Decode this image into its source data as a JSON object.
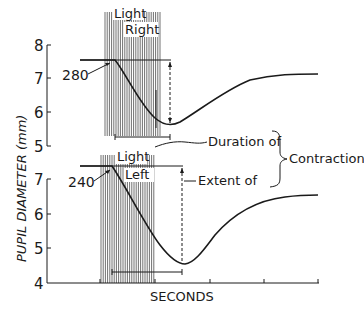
{
  "chart_data": {
    "type": "line",
    "ylabel": "PUPIL DIAMETER (mm)",
    "xlabel": "SECONDS",
    "grid": false,
    "panels": [
      {
        "name": "top",
        "stimulus_label": [
          "Light",
          "Right"
        ],
        "latency_label": "280",
        "yticks": [
          5,
          6,
          7,
          8
        ],
        "ylim": [
          5,
          8
        ],
        "series": [
          {
            "name": "pupil diameter (light right)",
            "x": [
              0,
              0.6,
              1.0,
              1.5,
              2.0,
              2.5,
              3.0,
              3.5,
              4.0
            ],
            "y": [
              7.5,
              7.5,
              6.8,
              6.0,
              5.6,
              6.0,
              6.6,
              6.95,
              7.1
            ]
          }
        ]
      },
      {
        "name": "bottom",
        "stimulus_label": [
          "Light",
          "Left"
        ],
        "latency_label": "240",
        "yticks": [
          4,
          5,
          6,
          7
        ],
        "ylim": [
          4,
          7.5
        ],
        "series": [
          {
            "name": "pupil diameter (light left)",
            "x": [
              0,
              0.55,
              1.0,
              1.5,
              2.0,
              2.5,
              3.0,
              3.5,
              4.0
            ],
            "y": [
              7.4,
              7.4,
              6.5,
              5.3,
              4.5,
              5.0,
              5.8,
              6.3,
              6.5
            ]
          }
        ]
      }
    ],
    "annotations": [
      "Duration of",
      "Extent of",
      "Contraction"
    ],
    "xticks_count": 5
  },
  "labels": {
    "ylabel": "PUPIL DIAMETER (mm)",
    "xlabel": "SECONDS",
    "top_light": "Light",
    "top_side": "Right",
    "top_latency": "280",
    "bottom_light": "Light",
    "bottom_side": "Left",
    "bottom_latency": "240",
    "duration": "Duration of",
    "extent": "Extent of",
    "contraction": "Contraction",
    "top_ticks": [
      "8",
      "7",
      "6",
      "5"
    ],
    "bottom_ticks": [
      "7",
      "6",
      "5",
      "4"
    ]
  }
}
